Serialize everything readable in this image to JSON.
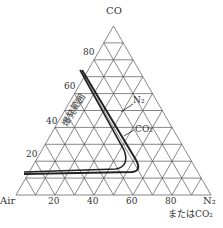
{
  "diagram": {
    "type": "ternary",
    "vertices": {
      "top": "CO",
      "left": "Air",
      "right_line1": "N₂",
      "right_line2": "またはCO₂"
    },
    "left_axis_ticks": [
      "20",
      "40",
      "60",
      "80"
    ],
    "bottom_axis_ticks": [
      "20",
      "40",
      "60",
      "80"
    ],
    "region_label": "爆発範囲",
    "curves": [
      {
        "name": "N₂",
        "label": "N₂"
      },
      {
        "name": "CO₂",
        "label": "CO₂"
      }
    ],
    "colors": {
      "grid": "#555555",
      "curve": "#222222",
      "text": "#333333"
    }
  }
}
